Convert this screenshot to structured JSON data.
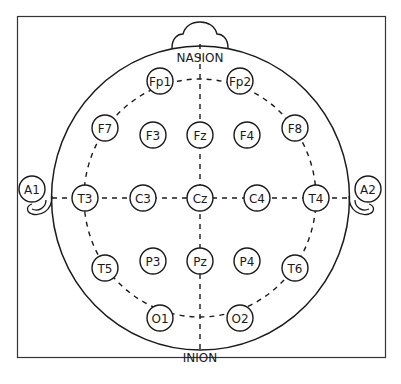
{
  "diagram": {
    "landmarks": {
      "top": "NASION",
      "bottom": "INION"
    },
    "colors": {
      "stroke": "#1a1a1a",
      "background": "#ffffff"
    },
    "electrodes": [
      {
        "id": "Fp1",
        "x": 160,
        "y": 81
      },
      {
        "id": "Fp2",
        "x": 240,
        "y": 81
      },
      {
        "id": "F7",
        "x": 105,
        "y": 128
      },
      {
        "id": "F3",
        "x": 153,
        "y": 135
      },
      {
        "id": "Fz",
        "x": 200,
        "y": 135
      },
      {
        "id": "F4",
        "x": 247,
        "y": 135
      },
      {
        "id": "F8",
        "x": 295,
        "y": 128
      },
      {
        "id": "T3",
        "x": 85,
        "y": 198
      },
      {
        "id": "C3",
        "x": 143,
        "y": 198
      },
      {
        "id": "Cz",
        "x": 200,
        "y": 198
      },
      {
        "id": "C4",
        "x": 257,
        "y": 198
      },
      {
        "id": "T4",
        "x": 316,
        "y": 198
      },
      {
        "id": "T5",
        "x": 105,
        "y": 268
      },
      {
        "id": "P3",
        "x": 153,
        "y": 261
      },
      {
        "id": "Pz",
        "x": 200,
        "y": 261
      },
      {
        "id": "P4",
        "x": 247,
        "y": 261
      },
      {
        "id": "T6",
        "x": 295,
        "y": 268
      },
      {
        "id": "O1",
        "x": 160,
        "y": 318
      },
      {
        "id": "O2",
        "x": 240,
        "y": 318
      },
      {
        "id": "A1",
        "x": 32,
        "y": 189
      },
      {
        "id": "A2",
        "x": 368,
        "y": 189
      }
    ]
  }
}
